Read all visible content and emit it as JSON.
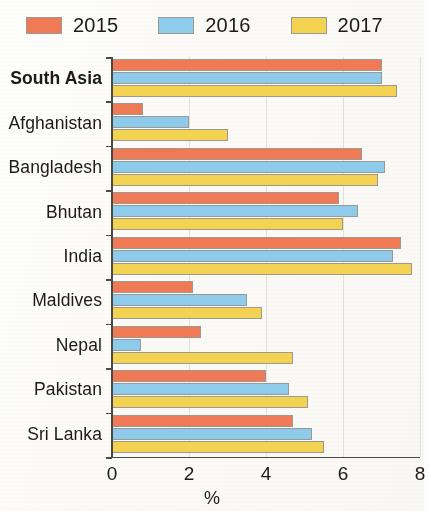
{
  "legend": {
    "items": [
      {
        "label": "2015",
        "color": "#F07A55",
        "icon": "legend-swatch-2015"
      },
      {
        "label": "2016",
        "color": "#8FCCEB",
        "icon": "legend-swatch-2016"
      },
      {
        "label": "2017",
        "color": "#F5D352",
        "icon": "legend-swatch-2017"
      }
    ]
  },
  "axis": {
    "x_ticks": [
      "0",
      "2",
      "4",
      "6",
      "8"
    ],
    "x_title": "%"
  },
  "categories": [
    {
      "label": "South Asia",
      "emphasis": true
    },
    {
      "label": "Afghanistan",
      "emphasis": false
    },
    {
      "label": "Bangladesh",
      "emphasis": false
    },
    {
      "label": "Bhutan",
      "emphasis": false
    },
    {
      "label": "India",
      "emphasis": false
    },
    {
      "label": "Maldives",
      "emphasis": false
    },
    {
      "label": "Nepal",
      "emphasis": false
    },
    {
      "label": "Pakistan",
      "emphasis": false
    },
    {
      "label": "Sri Lanka",
      "emphasis": false
    }
  ],
  "chart_data": {
    "type": "bar",
    "orientation": "horizontal",
    "title": "",
    "xlabel": "%",
    "ylabel": "",
    "xlim": [
      0,
      8
    ],
    "xticks": [
      0,
      2,
      4,
      6,
      8
    ],
    "grid": true,
    "legend_position": "top-left",
    "categories": [
      "South Asia",
      "Afghanistan",
      "Bangladesh",
      "Bhutan",
      "India",
      "Maldives",
      "Nepal",
      "Pakistan",
      "Sri Lanka"
    ],
    "series": [
      {
        "name": "2015",
        "color": "#F07A55",
        "values": [
          7.0,
          0.8,
          6.5,
          5.9,
          7.5,
          2.1,
          2.3,
          4.0,
          4.7
        ]
      },
      {
        "name": "2016",
        "color": "#8FCCEB",
        "values": [
          7.0,
          2.0,
          7.1,
          6.4,
          7.3,
          3.5,
          0.75,
          4.6,
          5.2
        ]
      },
      {
        "name": "2017",
        "color": "#F5D352",
        "values": [
          7.4,
          3.0,
          6.9,
          6.0,
          7.8,
          3.9,
          4.7,
          5.1,
          5.5
        ]
      }
    ]
  }
}
